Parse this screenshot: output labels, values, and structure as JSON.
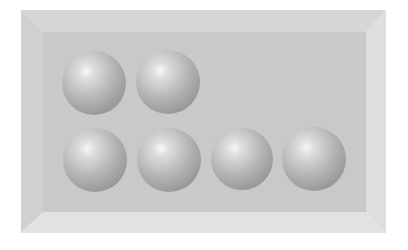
{
  "scene": {
    "description": "Gray beveled rectangular tray containing six shaded spheres arranged in two rows",
    "tray": {
      "outer": {
        "x": 21,
        "y": 10,
        "w": 365,
        "h": 223
      },
      "inner": {
        "x": 43,
        "y": 32,
        "w": 323,
        "h": 180
      },
      "colors": {
        "face": "#c9c9c9",
        "bevel_top": "#d6d6d6",
        "bevel_left": "#d0d0d0",
        "bevel_right": "#dedede",
        "bevel_bottom": "#e2e2e2"
      }
    },
    "rows": [
      {
        "name": "top-row",
        "count": 2,
        "spheres": [
          {
            "cx": 94,
            "cy": 83,
            "r": 32
          },
          {
            "cx": 168,
            "cy": 82,
            "r": 32
          }
        ]
      },
      {
        "name": "bottom-row",
        "count": 4,
        "spheres": [
          {
            "cx": 95,
            "cy": 160,
            "r": 32
          },
          {
            "cx": 169,
            "cy": 160,
            "r": 32
          },
          {
            "cx": 242,
            "cy": 159,
            "r": 31
          },
          {
            "cx": 314,
            "cy": 159,
            "r": 32
          }
        ]
      }
    ],
    "sphere_colors": {
      "highlight": "#f8f8f8",
      "mid": "#b4b4b4",
      "shadow": "#7e7e7e"
    },
    "total_spheres": 6
  }
}
